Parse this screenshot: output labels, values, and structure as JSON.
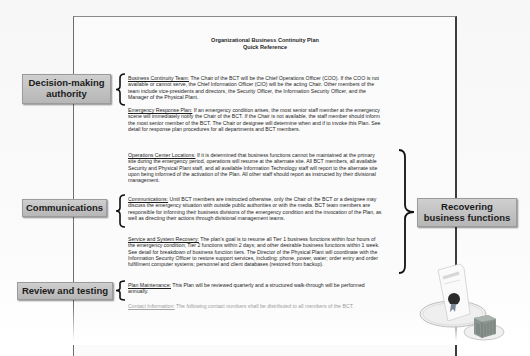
{
  "document": {
    "title_line1": "Organizational Business Continuity Plan",
    "title_line2": "Quick Reference",
    "sections": [
      {
        "heading": "Business Continuity Team:",
        "body": " The Chair of the BCT will be the Chief Operations Officer (COO).  If the COO is not available or cannot serve, the Chief Information Officer (CIO) will be the acting Chair.  Other members of the team include vice-presidents and directors, the Security Officer, the Information Security Officer, and the Manager of the Physical Plant."
      },
      {
        "heading": "Emergency Response Plan:",
        "body": " If an emergency condition arises, the most senior staff member at the emergency scene will immediately notify the Chair of the BCT. If the Chair is not available, the staff member should inform the most senior member of the BCT. The Chair or designee will determine when and if to invoke this Plan. See detail for response plan procedures for all departments and BCT members."
      },
      {
        "heading": "Operations Center Locations:",
        "body": " If it is determined that business functions cannot be maintained at the primary site during the emergency period, operations will resume at the alternate site.  All BCT members, all available Security and Physical Plant staff, and all available Information Technology staff will report to the alternate site upon being informed of the activation of the Plan. All other staff should report as instructed by their divisional management."
      },
      {
        "heading": "Communications:",
        "body": " Until BCT members are instructed otherwise, only the Chair of the BCT or a designee may discuss the emergency situation with outside public authorities or with the media. BCT team members are responsible for informing their business divisions of the emergency condition and the invocation of the Plan, as well as directing their actions through divisional management teams."
      },
      {
        "heading": "Service and System Recovery:",
        "body": " The plan's goal is to resume all Tier 1 business functions within four hours of the emergency condition; Tier 2 functions within 2 days; and other desirable business functions within 1 week. See detail for breakdown of business function tiers. The Director of the Physical Plant will coordinate with the Information Security Officer to restore support services, including: phone, power, water; order entry and order fulfillment computer systems; personnel and client databases (restored from backup)."
      },
      {
        "heading": "Plan Maintenance:",
        "body": "  This Plan will be reviewed quarterly and a structured walk-through will be performed annually."
      },
      {
        "heading": "Contact Information:",
        "body": " The following contact numbers shall be distributed to all members of the BCT."
      }
    ]
  },
  "callouts": {
    "decision_making": "Decision-making authority",
    "decision_line1": "Decision-making",
    "decision_line2": "authority",
    "communications": "Communications",
    "review_testing": "Review and testing",
    "recovering_line1": "Recovering",
    "recovering_line2": "business functions"
  },
  "illustration": {
    "icon": "certificate-with-building-icon"
  },
  "colors": {
    "label_fill": "#c3c3c3",
    "page_border": "#3c3c3c",
    "text": "#1e1e1e"
  }
}
